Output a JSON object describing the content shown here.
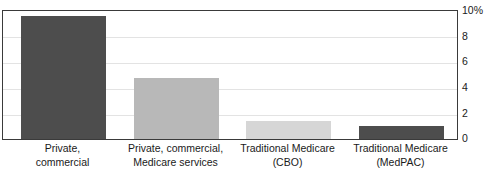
{
  "figure": {
    "cut_off_title": "",
    "background": "#ffffff",
    "plot_border_color": "#3a3a3a",
    "gridline_color": "#e3e3e3"
  },
  "chart_data": {
    "type": "bar",
    "title": "",
    "subtitle": "",
    "xlabel": "",
    "ylabel": "",
    "ylim": [
      0,
      10
    ],
    "y_axis_position": "right",
    "grid": "horizontal",
    "legend": "none",
    "y_ticks": [
      0,
      2,
      4,
      6,
      8,
      10
    ],
    "y_tick_labels": [
      "0",
      "2",
      "4",
      "6",
      "8",
      "10%"
    ],
    "categories": [
      "Private, commercial",
      "Private, commercial, Medicare services",
      "Traditional Medicare (CBO)",
      "Traditional Medicare (MedPAC)"
    ],
    "category_lines": [
      [
        "Private,",
        "commercial"
      ],
      [
        "Private, commercial,",
        "Medicare services"
      ],
      [
        "Traditional Medicare",
        "(CBO)"
      ],
      [
        "Traditional Medicare",
        "(MedPAC)"
      ]
    ],
    "values": [
      9.5,
      4.7,
      1.35,
      1.0
    ],
    "bar_colors": [
      "#4d4d4d",
      "#b8b8b8",
      "#d6d6d6",
      "#4d4d4d"
    ],
    "bar_geometry": [
      {
        "left": 18,
        "width": 85
      },
      {
        "left": 131,
        "width": 85
      },
      {
        "left": 243,
        "width": 85
      },
      {
        "left": 356,
        "width": 85
      }
    ]
  },
  "y_axis_labels": [
    {
      "value": 10,
      "text": "10%",
      "top": 5
    },
    {
      "value": 8,
      "text": "8",
      "top": 31
    },
    {
      "value": 6,
      "text": "6",
      "top": 56
    },
    {
      "value": 4,
      "text": "4",
      "top": 82
    },
    {
      "value": 2,
      "text": "2",
      "top": 108
    },
    {
      "value": 0,
      "text": "0",
      "top": 133
    }
  ]
}
